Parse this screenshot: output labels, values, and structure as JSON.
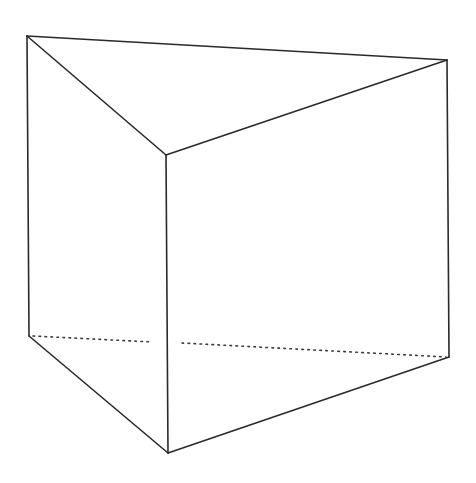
{
  "diagram": {
    "type": "triangular-prism",
    "background": "#ffffff",
    "line_color": "#2a2a2a",
    "vertices": {
      "top_left": [
        27,
        36
      ],
      "top_front": [
        166,
        155
      ],
      "top_right": [
        447,
        60
      ],
      "bottom_left": [
        29,
        336
      ],
      "bottom_front": [
        168,
        453
      ],
      "bottom_right": [
        449,
        357
      ]
    },
    "visible_edges": [
      {
        "name": "top-back-edge",
        "from": "top_left",
        "to": "top_right"
      },
      {
        "name": "top-left-edge",
        "from": "top_left",
        "to": "top_front"
      },
      {
        "name": "top-right-edge",
        "from": "top_front",
        "to": "top_right"
      },
      {
        "name": "left-vertical-edge",
        "from": "top_left",
        "to": "bottom_left"
      },
      {
        "name": "front-vertical-edge",
        "from": "top_front",
        "to": "bottom_front"
      },
      {
        "name": "right-vertical-edge",
        "from": "top_right",
        "to": "bottom_right"
      },
      {
        "name": "bottom-left-edge",
        "from": "bottom_left",
        "to": "bottom_front"
      },
      {
        "name": "bottom-right-edge",
        "from": "bottom_front",
        "to": "bottom_right"
      }
    ],
    "hidden_edges": [
      {
        "name": "bottom-back-hidden-edge-left",
        "from": [
          33,
          336
        ],
        "to": [
          152,
          342
        ]
      },
      {
        "name": "bottom-back-hidden-edge-right",
        "from": [
          182,
          343
        ],
        "to": [
          446,
          357
        ]
      }
    ]
  }
}
